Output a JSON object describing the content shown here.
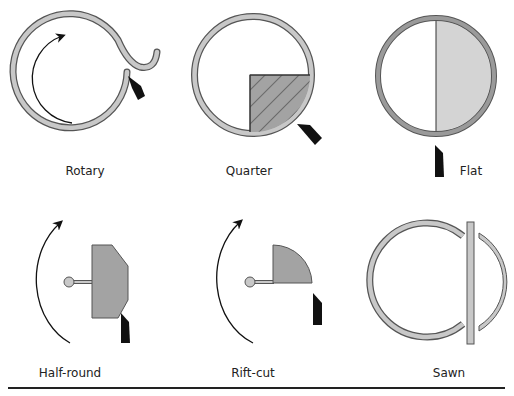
{
  "diagram": {
    "colors": {
      "ring_fill": "#c8c8c8",
      "ring_stroke": "#555555",
      "flitch_fill": "#a3a3a3",
      "half_fill": "#d4d4d4",
      "knife": "#111111",
      "arrow": "#111111",
      "rule": "#222222"
    },
    "panels": [
      {
        "id": "rotary",
        "label": "Rotary",
        "elements": [
          "log-ring",
          "veneer-tail",
          "knife",
          "rotation-arrow"
        ]
      },
      {
        "id": "quarter",
        "label": "Quarter",
        "elements": [
          "log-ring",
          "hatched-quarter-flitch",
          "knife"
        ]
      },
      {
        "id": "flat",
        "label": "Flat",
        "elements": [
          "log-ring",
          "half-log-flitch",
          "knife"
        ]
      },
      {
        "id": "half-round",
        "label": "Half-round",
        "elements": [
          "rotation-arrow",
          "hub",
          "flitch",
          "knife"
        ]
      },
      {
        "id": "rift-cut",
        "label": "Rift-cut",
        "elements": [
          "rotation-arrow",
          "hub",
          "quarter-flitch",
          "knife"
        ]
      },
      {
        "id": "sawn",
        "label": "Sawn",
        "elements": [
          "log-ring-cut",
          "saw-board",
          "slab-sliver"
        ]
      }
    ]
  }
}
